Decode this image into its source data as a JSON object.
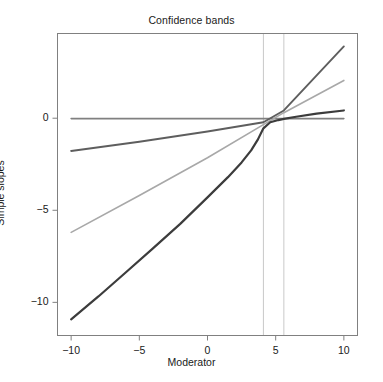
{
  "chart_data": {
    "type": "line",
    "title": "Confidence bands",
    "xlabel": "Moderator",
    "ylabel": "Simple slopes",
    "xlim": [
      -11,
      11
    ],
    "ylim": [
      -11.8,
      4.6
    ],
    "xticks": [
      -10,
      -5,
      0,
      5,
      10
    ],
    "xtick_labels": [
      "−10",
      "−5",
      "0",
      "5",
      "10"
    ],
    "yticks": [
      0,
      -5,
      -10
    ],
    "ytick_labels": [
      "0",
      "−5",
      "−10"
    ],
    "grid": false,
    "legend": "none",
    "frame": true,
    "series": [
      {
        "name": "Upper confidence band",
        "color": "#808080",
        "width": 1.6,
        "style": "solid",
        "x": [
          -10,
          -5,
          0,
          4.1,
          5.6,
          10
        ],
        "values": [
          -0.02,
          -0.02,
          -0.02,
          -0.02,
          -0.02,
          -0.02
        ]
      },
      {
        "name": "Lower confidence band",
        "color": "#a8a8a8",
        "width": 1.6,
        "style": "solid",
        "x": [
          -10,
          -5,
          0,
          4.1,
          5.6,
          10
        ],
        "values": [
          -6.2,
          -4.2,
          -2.15,
          -0.35,
          0.3,
          2.05
        ]
      },
      {
        "name": "Simple slope estimate",
        "color": "#5e5e5e",
        "width": 1.9,
        "style": "solid",
        "x": [
          -10,
          -5,
          0,
          4.1,
          5.6,
          10
        ],
        "values": [
          -1.78,
          -1.28,
          -0.72,
          -0.22,
          0.42,
          3.9
        ]
      },
      {
        "name": "Region of significance boundary curve",
        "color": "#3c3c3c",
        "width": 2.2,
        "style": "solid",
        "x": [
          -10,
          -8,
          -6,
          -4,
          -2,
          0,
          1.5,
          2.5,
          3.2,
          3.7,
          4.1,
          4.6,
          5.2,
          5.6,
          6.5,
          8,
          10
        ],
        "values": [
          -10.92,
          -9.68,
          -8.38,
          -7.07,
          -5.74,
          -4.3,
          -3.2,
          -2.4,
          -1.75,
          -1.15,
          -0.55,
          -0.22,
          -0.1,
          -0.04,
          0.08,
          0.25,
          0.42
        ]
      }
    ],
    "reference_lines": [
      {
        "name": "lower-region-boundary",
        "orientation": "vertical",
        "x": 4.1,
        "color": "#c9c9c9",
        "width": 1.0
      },
      {
        "name": "upper-region-boundary",
        "orientation": "vertical",
        "x": 5.6,
        "color": "#c9c9c9",
        "width": 1.0
      }
    ],
    "axis_color": "#808080",
    "text_color": "#1a1a1a",
    "background": "#ffffff"
  }
}
